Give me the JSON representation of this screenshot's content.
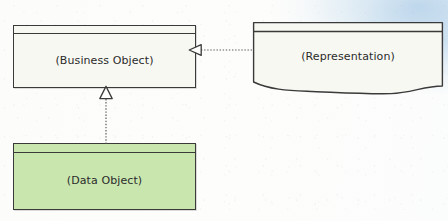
{
  "diagram": {
    "type": "uml-class-diagram",
    "background_color": "#fdfdfb",
    "nodes": [
      {
        "id": "business-object",
        "label": "(Business Object)",
        "shape": "rectangle-with-header-strip",
        "fill_color": "#f7f8f2",
        "border_color": "#3a3a3a"
      },
      {
        "id": "representation",
        "label": "(Representation)",
        "shape": "document-wavy-bottom",
        "fill_color": "#f7f8f2",
        "border_color": "#3a3a3a"
      },
      {
        "id": "data-object",
        "label": "(Data Object)",
        "shape": "rectangle-with-header-strip",
        "fill_color": "#c8e6ae",
        "border_color": "#3a3a3a"
      }
    ],
    "connectors": [
      {
        "id": "representation-realizes-business-object",
        "from": "representation",
        "to": "business-object",
        "style": "dotted",
        "arrow_head": "hollow-triangle",
        "direction": "left",
        "relationship": "realization"
      },
      {
        "id": "data-object-realizes-business-object",
        "from": "data-object",
        "to": "business-object",
        "style": "dotted",
        "arrow_head": "hollow-triangle",
        "direction": "up",
        "relationship": "realization"
      }
    ]
  }
}
